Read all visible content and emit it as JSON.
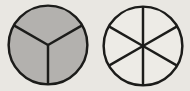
{
  "diagram": {
    "background_color": "#e9e7e2",
    "stroke_color": "#1c1c1a",
    "circles": [
      {
        "name": "circle-divided-into-thirds-shaded",
        "divisions": 3,
        "shaded_parts": 3,
        "fill": "#b3b1ae",
        "spoke_angles_deg": [
          30,
          150,
          270
        ]
      },
      {
        "name": "circle-divided-into-sixths-unshaded",
        "divisions": 6,
        "shaded_parts": 0,
        "fill": "#edebe6",
        "spoke_angles_deg": [
          30,
          90,
          150,
          210,
          270,
          330
        ]
      }
    ]
  }
}
